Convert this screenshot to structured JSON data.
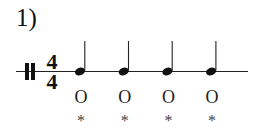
{
  "exercise": {
    "number_label": "1)"
  },
  "notation": {
    "clef": "percussion-clef",
    "time_signature": {
      "numerator": "4",
      "denominator": "4"
    },
    "notes": [
      {
        "type": "quarter",
        "count_label": "O",
        "beat_label": "*"
      },
      {
        "type": "quarter",
        "count_label": "O",
        "beat_label": "*"
      },
      {
        "type": "quarter",
        "count_label": "O",
        "beat_label": "*"
      },
      {
        "type": "quarter",
        "count_label": "O",
        "beat_label": "*"
      }
    ]
  },
  "colors": {
    "ink": "#111111"
  }
}
